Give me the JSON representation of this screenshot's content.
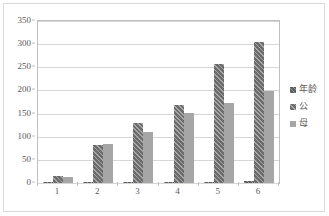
{
  "chart_data": {
    "type": "bar",
    "title": "",
    "subtitle": "",
    "xlabel": "",
    "ylabel": "",
    "categories": [
      "1",
      "2",
      "3",
      "4",
      "5",
      "6"
    ],
    "ylim": [
      0,
      350
    ],
    "yticks": [
      0,
      50,
      100,
      150,
      200,
      250,
      300,
      350
    ],
    "ytick_labels": [
      "0",
      "50",
      "100",
      "150",
      "200",
      "250",
      "300",
      "350"
    ],
    "grid": true,
    "legend_position": "right",
    "series": [
      {
        "name": "年龄",
        "color": "#5d5d5d",
        "pattern": "diagonal-hatch",
        "values": [
          1,
          1,
          1.5,
          2,
          2.5,
          4
        ]
      },
      {
        "name": "公",
        "color": "#6b6b6b",
        "pattern": "diagonal-hatch",
        "values": [
          15,
          82,
          130,
          169,
          257,
          305
        ]
      },
      {
        "name": "母",
        "color": "#a6a6a6",
        "pattern": "solid",
        "values": [
          12,
          84,
          110,
          152,
          173,
          199
        ]
      }
    ]
  },
  "legend": {
    "items": [
      {
        "label": "年龄"
      },
      {
        "label": "公"
      },
      {
        "label": "母"
      }
    ]
  },
  "colors": {
    "age": "#5d5d5d",
    "male": "#6b6b6b",
    "female": "#a6a6a6",
    "grid": "#d6d6d6",
    "axis": "#bfbfbf",
    "text": "#595959",
    "frame": "#d9d9d9"
  }
}
